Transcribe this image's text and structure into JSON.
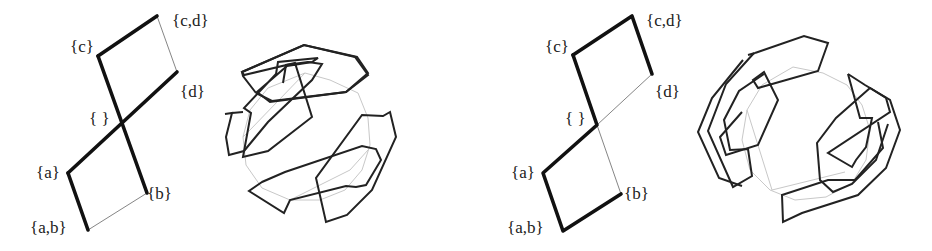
{
  "figure": {
    "panels": [
      {
        "id": "left",
        "lattice": {
          "labels": {
            "cd": "{c,d}",
            "c": "{c}",
            "d": "{d}",
            "empty": "{ }",
            "a": "{a}",
            "b": "{b}",
            "ab": "{a,b}"
          },
          "thick_edges": [
            "{c}-{c,d}",
            "{c}-{b}",
            "{a}-{d}",
            "{a}-{a,b}"
          ],
          "thin_edges": [
            "{c,d}-{d}",
            "{b}-{a,b}"
          ]
        },
        "knot_diagram": "closed polygonal curves around circle, two interlocked components"
      },
      {
        "id": "right",
        "lattice": {
          "labels": {
            "cd": "{c,d}",
            "c": "{c}",
            "d": "{d}",
            "empty": "{ }",
            "a": "{a}",
            "b": "{b}",
            "ab": "{a,b}"
          },
          "thick_edges": [
            "{c}-{c,d}",
            "{c,d}-{d}",
            "{c}-{ }",
            "{ }-{a}",
            "{a}-{a,b}",
            "{a,b}-{b}"
          ],
          "thin_edges": [
            "{ }-{d}",
            "{ }-{b}"
          ]
        },
        "knot_diagram": "closed polygonal curves around circle, nested components"
      }
    ],
    "colors": {
      "ink": "#111111",
      "thin": "#666666",
      "ghost": "#c8c8c8",
      "background": "#ffffff"
    }
  }
}
